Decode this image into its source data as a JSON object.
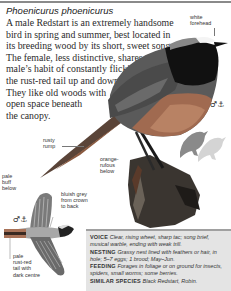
{
  "header": {
    "latin_name": "Phoenicurus phoenicurus"
  },
  "intro": {
    "lines": [
      "A male Redstart is an extremely handsome",
      "bird in spring and summer, best located in",
      "its breeding wood by its short, sweet song.",
      "The female, less distinctive, shares the",
      "male’s habit of constantly flicking",
      "the rust-red tail up and down.",
      "They like old woods with",
      "open space beneath",
      "the canopy."
    ]
  },
  "labels": {
    "white_forehead": [
      "white",
      "forehead"
    ],
    "rusty_rump": [
      "rusty",
      "rump"
    ],
    "orange_rufous": [
      "orange-",
      "rufous",
      "below"
    ],
    "pale_buff": [
      "pale",
      "buff",
      "below"
    ],
    "bluish_grey": [
      "bluish grey",
      "from crown",
      "to back"
    ],
    "pale_tail": [
      "pale",
      "rust-red",
      "tail with",
      "dark centre"
    ]
  },
  "sex_symbols": {
    "male_perched": "♂⚓",
    "male_flight": "♂⚓"
  },
  "info": {
    "voice_key": "VOICE",
    "voice_val": "Clear, rising wheet, sharp tac; song brief, musical warble, ending with weak trill.",
    "nesting_key": "NESTING",
    "nesting_val": "Grassy nest lined with feathers or hair, in hole; 5–7 eggs; 1 brood; May–Jun.",
    "feeding_key": "FEEDING",
    "feeding_val": "Forages in foliage or on ground for insects, spiders, small worms; some berries.",
    "similar_key": "SIMILAR SPECIES",
    "similar_val": "Black Redstart, Robin."
  },
  "colors": {
    "header_rule": "#8a8a8a",
    "infobox_bg": "#e4e4e4",
    "infobox_rule": "#a0a0a0",
    "silhouette_male": "#8a8a8a",
    "silhouette_female": "#d4d4d4"
  }
}
